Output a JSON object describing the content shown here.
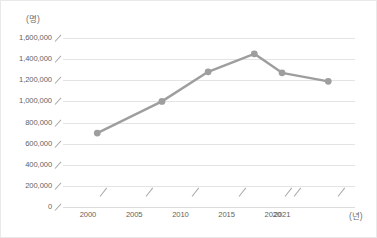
{
  "chart_data": {
    "type": "line",
    "title": "",
    "xlabel": "(년)",
    "ylabel": "(명)",
    "x": [
      2001,
      2008,
      2013,
      2018,
      2021,
      2026
    ],
    "values": [
      700000,
      1000000,
      1280000,
      1450000,
      1270000,
      1190000
    ],
    "series": [
      {
        "name": "",
        "values": [
          700000,
          1000000,
          1280000,
          1450000,
          1270000,
          1190000
        ]
      }
    ],
    "xtick_labels": [
      "2000",
      "2005",
      "2010",
      "2015",
      "2020",
      "2021"
    ],
    "xtick_values": [
      2000,
      2005,
      2010,
      2015,
      2020,
      2021
    ],
    "ytick_labels": [
      "1,600,000",
      "1,400,000",
      "1,200,000",
      "1,000,000",
      "800,000",
      "600,000",
      "400,000",
      "200,000",
      "0"
    ],
    "ytick_values": [
      1600000,
      1400000,
      1200000,
      1000000,
      800000,
      600000,
      400000,
      200000,
      0
    ],
    "ylim": [
      0,
      1600000
    ],
    "grid": "horizontal",
    "legend": "none",
    "line_color": "#9e9e9e",
    "marker_color": "#9e9e9e",
    "grid_color": "#e4e4e4",
    "text_color": "#5f5f5f"
  },
  "axis": {
    "y_unit_label": "(명)",
    "x_unit_label": "(년)"
  }
}
